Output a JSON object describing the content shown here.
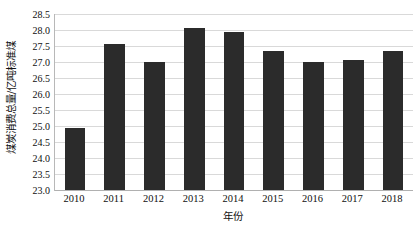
{
  "chart_data": {
    "type": "bar",
    "title": "",
    "subtitle": "",
    "xlabel": "年份",
    "ylabel": "煤炭消费总量/亿吨标准煤",
    "categories": [
      "2010",
      "2011",
      "2012",
      "2013",
      "2014",
      "2015",
      "2016",
      "2017",
      "2018"
    ],
    "values": [
      24.93,
      27.55,
      27.0,
      28.07,
      27.95,
      27.35,
      27.0,
      27.06,
      27.35
    ],
    "series": [
      {
        "name": "煤炭消费总量",
        "values": [
          24.93,
          27.55,
          27.0,
          28.07,
          27.95,
          27.35,
          27.0,
          27.06,
          27.35
        ]
      }
    ],
    "ylim": [
      23.0,
      28.5
    ],
    "ytick_labels": [
      "23.0",
      "23.5",
      "24.0",
      "24.5",
      "25.0",
      "25.5",
      "26.0",
      "26.5",
      "27.0",
      "27.5",
      "28.0",
      "28.5"
    ],
    "ytick_values": [
      23.0,
      23.5,
      24.0,
      24.5,
      25.0,
      25.5,
      26.0,
      26.5,
      27.0,
      27.5,
      28.0,
      28.5
    ],
    "ytick_step": 0.5,
    "grid": true,
    "grid_axis": "y",
    "legend": false,
    "legend_position": "none",
    "bar_color": "#2b2b2b",
    "grid_color": "#d9d9d9",
    "axis_color": "#b8b8b8",
    "background_color": "#ffffff",
    "annotations": []
  }
}
